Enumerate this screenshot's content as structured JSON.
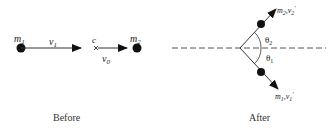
{
  "before": {
    "caption": "Before",
    "mass1": {
      "label": "m",
      "sub": "1"
    },
    "velocity1": {
      "label": "v",
      "sub": "1"
    },
    "center": {
      "label": "c"
    },
    "velocity0": {
      "label": "v",
      "sub": "0"
    },
    "mass2": {
      "label": "m",
      "sub": "2"
    }
  },
  "after": {
    "caption": "After",
    "upper": {
      "mass": "m",
      "mass_sub": "2",
      "sep": ",",
      "vel": "v",
      "vel_sub": "2",
      "prime": "'"
    },
    "lower": {
      "mass": "m",
      "mass_sub": "1",
      "sep": ",",
      "vel": "v",
      "vel_sub": "1",
      "prime": "'"
    },
    "theta2": {
      "label": "θ",
      "sub": "2"
    },
    "theta1": {
      "label": "θ",
      "sub": "1"
    }
  },
  "colors": {
    "ink": "#111111",
    "line": "#444444"
  }
}
